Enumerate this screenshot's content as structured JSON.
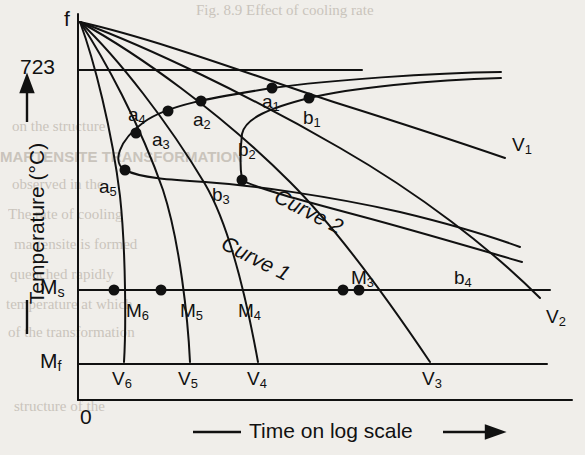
{
  "figure": {
    "axes": {
      "y_title": "Temperature (°C)",
      "x_title": "Time on log scale",
      "y_ticks": [
        "723",
        "Ms",
        "Mf",
        "0"
      ],
      "y_tick_723": "723",
      "y_tick_ms_base": "M",
      "y_tick_ms_sub": "s",
      "y_tick_mf_base": "M",
      "y_tick_mf_sub": "f",
      "y_tick_zero": "0"
    },
    "origin_label": "f",
    "curve_labels": [
      {
        "text": "Curve 1",
        "x": 228,
        "y": 232,
        "rot": 27
      },
      {
        "text": "Curve 2",
        "x": 281,
        "y": 185,
        "rot": 27
      }
    ],
    "point_labels": [
      {
        "base": "a",
        "sub": "1",
        "x": 262,
        "y": 92
      },
      {
        "base": "a",
        "sub": "2",
        "x": 193,
        "y": 110
      },
      {
        "base": "a",
        "sub": "3",
        "x": 152,
        "y": 130
      },
      {
        "base": "a",
        "sub": "4",
        "x": 128,
        "y": 105
      },
      {
        "base": "a",
        "sub": "5",
        "x": 99,
        "y": 177
      },
      {
        "base": "b",
        "sub": "1",
        "x": 303,
        "y": 108
      },
      {
        "base": "b",
        "sub": "2",
        "x": 238,
        "y": 140
      },
      {
        "base": "b",
        "sub": "3",
        "x": 212,
        "y": 185
      },
      {
        "base": "b",
        "sub": "4",
        "x": 454,
        "y": 268
      },
      {
        "base": "M",
        "sub": "3",
        "x": 351,
        "y": 268
      },
      {
        "base": "M",
        "sub": "4",
        "x": 238,
        "y": 301
      },
      {
        "base": "M",
        "sub": "5",
        "x": 180,
        "y": 301
      },
      {
        "base": "M",
        "sub": "6",
        "x": 126,
        "y": 301
      },
      {
        "base": "V",
        "sub": "1",
        "x": 512,
        "y": 135
      },
      {
        "base": "V",
        "sub": "2",
        "x": 546,
        "y": 307
      },
      {
        "base": "V",
        "sub": "3",
        "x": 422,
        "y": 369
      },
      {
        "base": "V",
        "sub": "4",
        "x": 247,
        "y": 369
      },
      {
        "base": "V",
        "sub": "5",
        "x": 178,
        "y": 369
      },
      {
        "base": "V",
        "sub": "6",
        "x": 112,
        "y": 369
      }
    ],
    "ghost_text": [
      {
        "text": "Fig. 8.9  Effect of cooling rate",
        "x": 196,
        "y": 2,
        "bold": false
      },
      {
        "text": "on the structure",
        "x": 12,
        "y": 118,
        "bold": false
      },
      {
        "text": "MARTENSITE TRANSFORMATION",
        "x": 0,
        "y": 148,
        "bold": true
      },
      {
        "text": "observed in the",
        "x": 12,
        "y": 176,
        "bold": false
      },
      {
        "text": "The rate of cooling",
        "x": 8,
        "y": 206,
        "bold": false
      },
      {
        "text": "martensite is formed",
        "x": 14,
        "y": 236,
        "bold": false
      },
      {
        "text": "quenched rapidly",
        "x": 10,
        "y": 266,
        "bold": false
      },
      {
        "text": "temperature at which",
        "x": 6,
        "y": 296,
        "bold": false
      },
      {
        "text": "of the transformation",
        "x": 8,
        "y": 324,
        "bold": false
      },
      {
        "text": "structure of the",
        "x": 14,
        "y": 398,
        "bold": false
      }
    ]
  },
  "chart_data": {
    "type": "line",
    "xlabel": "Time on log scale",
    "ylabel": "Temperature (°C)",
    "grid": false,
    "legend": "none",
    "axis_reference_lines": [
      {
        "label": "723",
        "temperature": 723,
        "y_px": 70
      },
      {
        "label": "Ms",
        "name": "Martensite start",
        "y_px": 290
      },
      {
        "label": "Mf",
        "name": "Martensite finish",
        "y_px": 364
      },
      {
        "label": "0",
        "y_px": 400
      }
    ],
    "c_curves": [
      {
        "name": "Curve 1",
        "note": "transformation start (outer C-curve)"
      },
      {
        "name": "Curve 2",
        "note": "transformation finish (inner C-curve)"
      }
    ],
    "cooling_curves": [
      {
        "name": "V1",
        "start": "f",
        "intersections": [
          "a1",
          "b1"
        ],
        "end_px": [
          505,
          130
        ],
        "note": "fastest shown of slow rates; crosses both C-curves above Ms"
      },
      {
        "name": "V2",
        "start": "f",
        "intersections": [
          "b4"
        ],
        "end_px": [
          540,
          298
        ],
        "note": "crosses Ms line, labelled V2"
      },
      {
        "name": "V3",
        "start": "f",
        "intersections": [
          "M3"
        ],
        "end_px": [
          430,
          362
        ],
        "note": "critical cooling rate region; M3 on Ms line"
      },
      {
        "name": "V4",
        "start": "f",
        "intersections": [
          "a2",
          "b3"
        ],
        "end_px": [
          258,
          362
        ],
        "note": "M4 between Ms and Mf"
      },
      {
        "name": "V5",
        "start": "f",
        "intersections": [
          "a3"
        ],
        "end_px": [
          190,
          362
        ],
        "note": "M5 between Ms and Mf"
      },
      {
        "name": "V6",
        "start": "f",
        "intersections": [
          "a5"
        ],
        "end_px": [
          124,
          362
        ],
        "note": "M6 between Ms and Mf"
      }
    ],
    "marked_points": [
      {
        "label": "a1",
        "x_px": 272,
        "y_px": 88
      },
      {
        "label": "a2",
        "x_px": 201,
        "y_px": 101
      },
      {
        "label": "a3",
        "x_px": 168,
        "y_px": 111
      },
      {
        "label": "a4",
        "x_px": 168,
        "y_px": 111
      },
      {
        "label": "a5",
        "x_px": 125,
        "y_px": 170
      },
      {
        "label": "b1",
        "x_px": 309,
        "y_px": 98
      },
      {
        "label": "b3",
        "x_px": 242,
        "y_px": 180
      },
      {
        "label": "M6",
        "x_px": 114,
        "y_px": 290
      },
      {
        "label": "M5",
        "x_px": 161,
        "y_px": 290
      },
      {
        "label": "M3a",
        "x_px": 343,
        "y_px": 290
      },
      {
        "label": "M3b",
        "x_px": 359,
        "y_px": 290
      }
    ]
  }
}
